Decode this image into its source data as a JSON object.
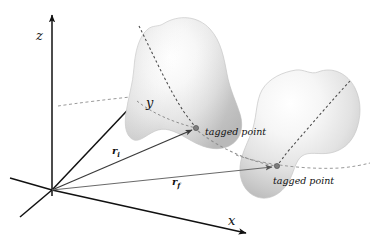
{
  "figure": {
    "type": "diagram",
    "background_color": "#ffffff",
    "ink_color": "#111111"
  },
  "axes": {
    "z": {
      "label": "z",
      "direction": "up",
      "origin": [
        52,
        190
      ],
      "tip": [
        52,
        12
      ]
    },
    "y": {
      "label": "y",
      "direction": "diagonal-up-right",
      "origin": [
        52,
        190
      ],
      "tip": [
        158,
        78
      ]
    },
    "x": {
      "label": "x",
      "direction": "down-right",
      "origin": [
        52,
        190
      ],
      "tip": [
        248,
        234
      ]
    }
  },
  "vectors": [
    {
      "name": "r-initial",
      "label": "r",
      "subscript": "i",
      "from": [
        52,
        190
      ],
      "to": [
        196,
        128
      ],
      "target": "tagged point on initial configuration"
    },
    {
      "name": "r-final",
      "label": "r",
      "subscript": "f",
      "from": [
        52,
        190
      ],
      "to": [
        277,
        166
      ],
      "target": "tagged point on final configuration"
    }
  ],
  "bodies": [
    {
      "name": "initial-configuration",
      "fill": "#e9e9e9",
      "highlight": "#fdfdfd",
      "shade": "#b9b9b9",
      "tagged_point": {
        "label": "tagged point",
        "at": [
          196,
          128
        ]
      }
    },
    {
      "name": "final-configuration",
      "fill": "#e9e9e9",
      "highlight": "#fdfdfd",
      "shade": "#b9b9b9",
      "tagged_point": {
        "label": "tagged point",
        "at": [
          277,
          166
        ]
      }
    }
  ],
  "dashed_curves": [
    {
      "name": "material-line-initial-body",
      "style": "dashed"
    },
    {
      "name": "material-line-final-body",
      "style": "dashed"
    },
    {
      "name": "trajectory-between-tagged-points",
      "style": "dashed"
    },
    {
      "name": "y-axis-extension",
      "style": "dashed"
    },
    {
      "name": "horizontal-reference-through-final-body",
      "style": "dashed"
    }
  ],
  "labels": {
    "axis_z": "z",
    "axis_y": "y",
    "axis_x": "x",
    "r_initial": "r",
    "r_initial_sub": "i",
    "r_final": "r",
    "r_final_sub": "f",
    "tagged_point_initial": "tagged point",
    "tagged_point_final": "tagged point"
  }
}
